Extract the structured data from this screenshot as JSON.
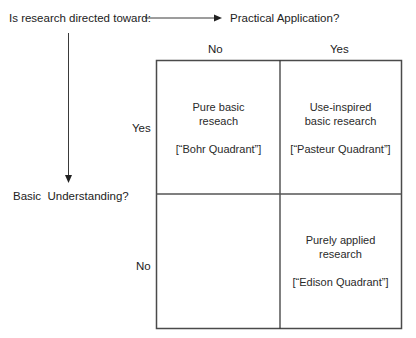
{
  "diagram": {
    "question": "Is research directed toward:",
    "x_axis_label": "Practical Application?",
    "y_axis_label": "Basic  Understanding?",
    "column_headers": [
      "No",
      "Yes"
    ],
    "row_headers": [
      "Yes",
      "No"
    ],
    "quadrants": {
      "top_left": {
        "title_line1": "Pure basic",
        "title_line2": "reseach",
        "name": "[“Bohr Quadrant”]"
      },
      "top_right": {
        "title_line1": "Use-inspired",
        "title_line2": "basic research",
        "name": "[“Pasteur Quadrant”]"
      },
      "bottom_left": {
        "title_line1": "",
        "title_line2": "",
        "name": ""
      },
      "bottom_right": {
        "title_line1": "Purely applied",
        "title_line2": "research",
        "name": "[“Edison Quadrant”]"
      }
    },
    "colors": {
      "line": "#3a3a3a",
      "text": "#222222",
      "background": "#ffffff"
    }
  }
}
